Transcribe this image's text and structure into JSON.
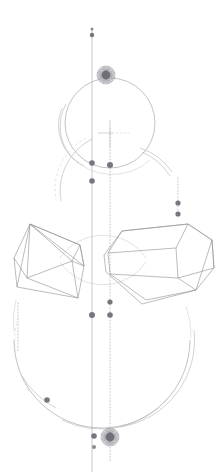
{
  "artwork": {
    "title": "Geometric Line Art Composition",
    "canvas": {
      "width": 223,
      "height": 472,
      "background": "#ffffff"
    },
    "palette": {
      "line": "#9a9aa0",
      "line_soft": "#b6b6bb",
      "line_faint": "#cfcfd4",
      "polyhedron": "#8e8e96",
      "dot": "#76767e",
      "burst": "#6f6f78"
    },
    "axes": [
      {
        "name": "primary-vertical-axis",
        "style": "solid",
        "x": 92,
        "y1": 30,
        "y2": 472
      },
      {
        "name": "secondary-vertical-axis",
        "style": "dotted",
        "x": 110,
        "y1": 128,
        "y2": 462
      }
    ],
    "circles": [
      {
        "name": "upper-circle",
        "cx": 110,
        "cy": 123,
        "r": 45,
        "style": "solid"
      },
      {
        "name": "upper-circle-echo",
        "cx": 106,
        "cy": 125,
        "r": 45,
        "style": "arc"
      },
      {
        "name": "lower-circle",
        "cx": 102,
        "cy": 340,
        "r": 88,
        "style": "solid"
      },
      {
        "name": "lower-circle-echo",
        "cx": 106,
        "cy": 336,
        "r": 88,
        "style": "arc"
      }
    ],
    "bursts": [
      {
        "name": "upper-starburst",
        "cx": 106,
        "cy": 75,
        "r": 9,
        "rays": 22
      },
      {
        "name": "lower-starburst",
        "cx": 110,
        "cy": 437,
        "r": 9,
        "rays": 22
      }
    ],
    "polyhedra": [
      {
        "name": "left-polyhedron",
        "kind": "wireframe-prism",
        "bbox": [
          14,
          218,
          84,
          297
        ]
      },
      {
        "name": "right-polyhedron",
        "kind": "wireframe-pentagonal-prism",
        "bbox": [
          104,
          222,
          214,
          304
        ]
      }
    ],
    "nodes": [
      {
        "name": "node-top-small",
        "cx": 92,
        "cy": 29,
        "r": 1.5
      },
      {
        "name": "node-top",
        "cx": 92,
        "cy": 35,
        "r": 2.2
      },
      {
        "name": "node-circle-left",
        "cx": 92,
        "cy": 163,
        "r": 2.8
      },
      {
        "name": "node-circle-right",
        "cx": 110,
        "cy": 165,
        "r": 3.0
      },
      {
        "name": "node-below-circle",
        "cx": 92,
        "cy": 181,
        "r": 2.8
      },
      {
        "name": "node-right-upper",
        "cx": 178,
        "cy": 203,
        "r": 2.6
      },
      {
        "name": "node-right-lower",
        "cx": 178,
        "cy": 214,
        "r": 2.6
      },
      {
        "name": "node-mid-secondary",
        "cx": 110,
        "cy": 302,
        "r": 2.6
      },
      {
        "name": "node-mid-primary",
        "cx": 92,
        "cy": 315,
        "r": 3.0
      },
      {
        "name": "node-mid-pair",
        "cx": 110,
        "cy": 315,
        "r": 2.8
      },
      {
        "name": "node-arc-left",
        "cx": 47,
        "cy": 400,
        "r": 2.8
      },
      {
        "name": "node-bottom",
        "cx": 94,
        "cy": 436,
        "r": 2.8
      },
      {
        "name": "node-bottom-small",
        "cx": 94,
        "cy": 447,
        "r": 2.0
      }
    ],
    "marks": [
      {
        "name": "crosshair-mark",
        "cx": 110,
        "cy": 133,
        "arm": 14
      },
      {
        "name": "crosshair-dashed-arm",
        "x1": 112,
        "x2": 128,
        "y": 133
      }
    ]
  }
}
